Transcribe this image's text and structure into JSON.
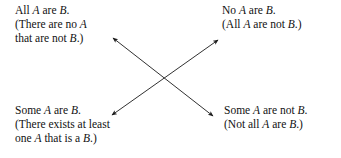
{
  "figure": {
    "name": "square-of-opposition",
    "background_color": "#ffffff",
    "text_color": "#111111",
    "arrow_color": "#1a1a1a"
  },
  "propositions": {
    "universal_affirmative": {
      "lines": [
        {
          "segments": [
            {
              "t": "All ",
              "italic": false
            },
            {
              "t": "A",
              "italic": true
            },
            {
              "t": " are ",
              "italic": false
            },
            {
              "t": "B",
              "italic": true
            },
            {
              "t": ".",
              "italic": false
            }
          ]
        },
        {
          "segments": [
            {
              "t": "(There are no ",
              "italic": false
            },
            {
              "t": "A",
              "italic": true
            }
          ]
        },
        {
          "segments": [
            {
              "t": "that are not ",
              "italic": false
            },
            {
              "t": "B",
              "italic": true
            },
            {
              "t": ".)",
              "italic": false
            }
          ]
        }
      ]
    },
    "universal_negative": {
      "lines": [
        {
          "segments": [
            {
              "t": "No ",
              "italic": false
            },
            {
              "t": "A",
              "italic": true
            },
            {
              "t": " are ",
              "italic": false
            },
            {
              "t": "B",
              "italic": true
            },
            {
              "t": ".",
              "italic": false
            }
          ]
        },
        {
          "segments": [
            {
              "t": "(All ",
              "italic": false
            },
            {
              "t": "A",
              "italic": true
            },
            {
              "t": " are not ",
              "italic": false
            },
            {
              "t": "B",
              "italic": true
            },
            {
              "t": ".)",
              "italic": false
            }
          ]
        }
      ]
    },
    "particular_affirmative": {
      "lines": [
        {
          "segments": [
            {
              "t": "Some ",
              "italic": false
            },
            {
              "t": "A",
              "italic": true
            },
            {
              "t": " are ",
              "italic": false
            },
            {
              "t": "B",
              "italic": true
            },
            {
              "t": ".",
              "italic": false
            }
          ]
        },
        {
          "segments": [
            {
              "t": "(There exists at least",
              "italic": false
            }
          ]
        },
        {
          "segments": [
            {
              "t": "one ",
              "italic": false
            },
            {
              "t": "A",
              "italic": true
            },
            {
              "t": " that is a ",
              "italic": false
            },
            {
              "t": "B",
              "italic": true
            },
            {
              "t": ".)",
              "italic": false
            }
          ]
        }
      ]
    },
    "particular_negative": {
      "lines": [
        {
          "segments": [
            {
              "t": "Some ",
              "italic": false
            },
            {
              "t": "A",
              "italic": true
            },
            {
              "t": " are not ",
              "italic": false
            },
            {
              "t": "B",
              "italic": true
            },
            {
              "t": ".",
              "italic": false
            }
          ]
        },
        {
          "segments": [
            {
              "t": "(Not all ",
              "italic": false
            },
            {
              "t": "A",
              "italic": true
            },
            {
              "t": " are ",
              "italic": false
            },
            {
              "t": "B",
              "italic": true
            },
            {
              "t": ".)",
              "italic": false
            }
          ]
        }
      ]
    }
  },
  "connectors": [
    {
      "name": "contradictory-arrow-a-to-o",
      "from": {
        "x": 113,
        "y": 38
      },
      "to": {
        "x": 213,
        "y": 116
      },
      "double_headed": true
    },
    {
      "name": "contradictory-arrow-e-to-i",
      "from": {
        "x": 218,
        "y": 40
      },
      "to": {
        "x": 112,
        "y": 115
      },
      "double_headed": true
    }
  ]
}
